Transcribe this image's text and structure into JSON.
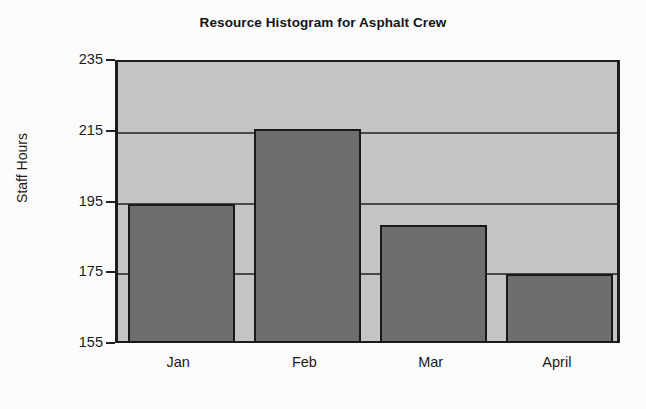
{
  "chart_data": {
    "type": "bar",
    "title": "Resource Histogram for Asphalt Crew",
    "xlabel": "",
    "ylabel": "Staff Hours",
    "categories": [
      "Jan",
      "Feb",
      "Mar",
      "April"
    ],
    "values": [
      195,
      216,
      189,
      175
    ],
    "ylim": [
      155,
      235
    ],
    "yticks": [
      155,
      175,
      195,
      215,
      235
    ],
    "ytick_labels": [
      "155",
      "175",
      "195",
      "215",
      "235"
    ],
    "grid": true,
    "legend": "none",
    "colors": {
      "bar_fill": "#6e6e6e",
      "bar_edge": "#191919",
      "plot_background": "#c4c4c4",
      "gridline": "#4a4a4a",
      "axis": "#1c1c1c",
      "text": "#1a1a1a",
      "figure_background": "#fbfbfb"
    }
  }
}
